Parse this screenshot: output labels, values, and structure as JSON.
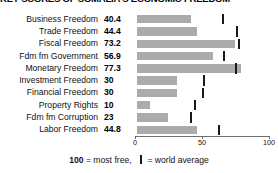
{
  "chart_data": {
    "type": "bar",
    "title": "KEY SCORES OF SOMALIA'S ECONOMIC FREEDOM",
    "xlabel": "",
    "ylabel": "",
    "xlim": [
      0,
      100
    ],
    "grid": false,
    "orientation": "horizontal",
    "legend_position": "bottom",
    "categories": [
      "Business Freedom",
      "Trade Freedom",
      "Fiscal Freedom",
      "Fdm fm Government",
      "Monetary Freedom",
      "Investment Freedom",
      "Financial Freedom",
      "Property Rights",
      "Fdm fm Corruption",
      "Labor Freedom"
    ],
    "values": [
      40.4,
      44.4,
      73.2,
      56.9,
      77.3,
      30,
      30,
      10,
      23,
      44.8
    ],
    "value_labels": [
      "40.4",
      "44.4",
      "73.2",
      "56.9",
      "77.3",
      "30",
      "30",
      "10",
      "23",
      "44.8"
    ],
    "series": [
      {
        "name": "Somalia score",
        "values": [
          40.4,
          44.4,
          73.2,
          56.9,
          77.3,
          30,
          30,
          10,
          23,
          44.8
        ]
      },
      {
        "name": "world average",
        "values": [
          64.3,
          74.8,
          76.3,
          65.0,
          74.0,
          50.0,
          49.0,
          43.0,
          40.0,
          61.5
        ]
      }
    ],
    "world_average_label": "world average",
    "ticks": [
      {
        "value": 0,
        "label": "0"
      },
      {
        "value": 50,
        "label": "50"
      },
      {
        "value": 100,
        "label": "100"
      }
    ],
    "colors": {
      "bar": "#ababab",
      "marker": "#1a1a1a",
      "axis": "#6f6f6f",
      "text": "#111111",
      "background": "#ffffff"
    }
  },
  "footer": {
    "max_note_value": "100",
    "max_note_text": "= most free,",
    "marker_note_text": "= world average"
  }
}
